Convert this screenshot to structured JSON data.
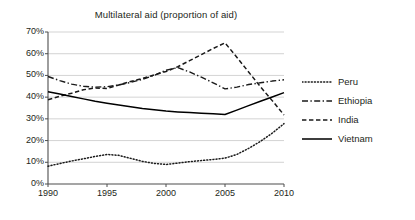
{
  "chart_data": {
    "type": "line",
    "title": "Multilateral aid (proportion of aid)",
    "xlabel": "",
    "ylabel": "",
    "xlim": [
      1990,
      2010
    ],
    "ylim": [
      0,
      70
    ],
    "grid": true,
    "grid_axis": "y",
    "legend_position": "right",
    "x_ticks": [
      "1990",
      "1995",
      "2000",
      "2005",
      "2010"
    ],
    "x_tick_values": [
      1990,
      1995,
      2000,
      2005,
      2010
    ],
    "y_ticks": [
      "0%",
      "10%",
      "20%",
      "30%",
      "40%",
      "50%",
      "60%",
      "70%"
    ],
    "y_tick_values": [
      0,
      10,
      20,
      30,
      40,
      50,
      60,
      70
    ],
    "x": [
      1990,
      1991,
      1992,
      1993,
      1994,
      1995,
      1996,
      1997,
      1998,
      1999,
      2000,
      2001,
      2002,
      2003,
      2004,
      2005,
      2006,
      2007,
      2008,
      2009,
      2010
    ],
    "series": [
      {
        "name": "Peru",
        "style": "dotted",
        "color": "#1a1a1a",
        "values": [
          8.2,
          9.4,
          10.6,
          11.6,
          12.7,
          13.6,
          13.2,
          11.8,
          10.4,
          9.5,
          9.0,
          9.6,
          10.3,
          10.8,
          11.3,
          11.9,
          13.6,
          16.4,
          19.6,
          23.4,
          27.8
        ]
      },
      {
        "name": "Ethiopia",
        "style": "dash-dot",
        "color": "#1a1a1a",
        "values": [
          49.5,
          47.6,
          46.0,
          45.0,
          44.6,
          44.8,
          45.6,
          46.8,
          48.2,
          50.0,
          52.4,
          53.6,
          51.6,
          49.2,
          46.6,
          43.8,
          44.6,
          45.8,
          46.6,
          47.4,
          48.0
        ]
      },
      {
        "name": "India",
        "style": "dashed",
        "color": "#1a1a1a",
        "values": [
          38.8,
          40.4,
          41.8,
          43.4,
          44.2,
          44.0,
          45.6,
          47.2,
          48.6,
          50.2,
          51.8,
          54.0,
          56.8,
          59.6,
          62.4,
          65.0,
          58.4,
          51.6,
          44.8,
          38.4,
          31.8
        ]
      },
      {
        "name": "Vietnam",
        "style": "solid",
        "color": "#000000",
        "values": [
          42.5,
          41.4,
          40.3,
          39.2,
          38.1,
          37.2,
          36.4,
          35.6,
          34.8,
          34.2,
          33.6,
          33.2,
          32.9,
          32.6,
          32.3,
          32.0,
          34.0,
          36.1,
          38.1,
          40.1,
          42.1
        ]
      }
    ]
  },
  "legend": {
    "items": [
      {
        "label": "Peru",
        "style": "dotted"
      },
      {
        "label": "Ethiopia",
        "style": "dash-dot"
      },
      {
        "label": "India",
        "style": "dashed"
      },
      {
        "label": "Vietnam",
        "style": "solid"
      }
    ]
  }
}
